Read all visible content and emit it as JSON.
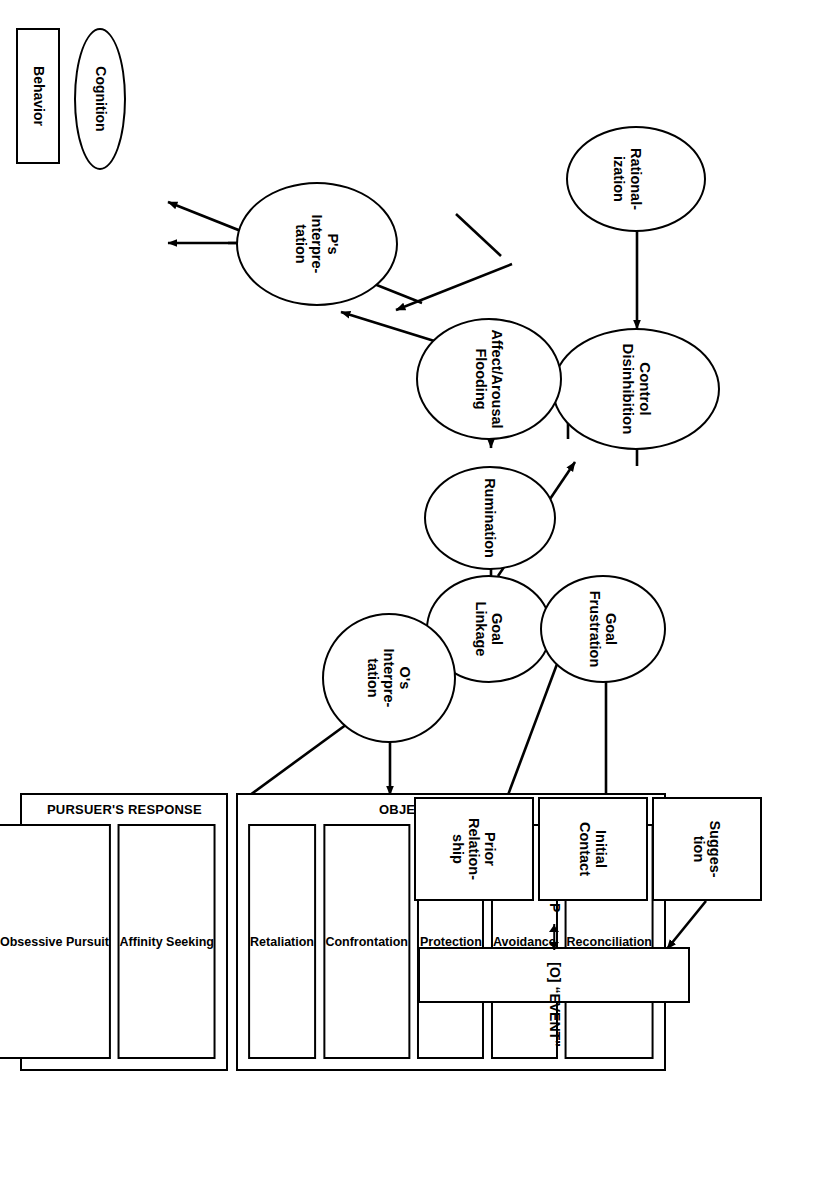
{
  "figure": {
    "type": "flowchart-diagram",
    "orientation": "rotated-90-clockwise",
    "stroke_color": "#000000",
    "background_color": "#ffffff"
  },
  "legend": {
    "cognition_label": "Cognition",
    "behavior_label": "Behavior",
    "cognition_shape": "ellipse",
    "behavior_shape": "rectangle"
  },
  "cognition_nodes": [
    {
      "id": "rationalization",
      "label_lines": [
        "Rational-",
        "ization"
      ]
    },
    {
      "id": "control_disinhibition",
      "label_lines": [
        "Control",
        "Disinhibition"
      ]
    },
    {
      "id": "rumination",
      "label_lines": [
        "Rumination"
      ]
    },
    {
      "id": "affect_arousal_flooding",
      "label_lines": [
        "Affect/Arousal",
        "Flooding"
      ]
    },
    {
      "id": "ps_interpretation",
      "label_lines": [
        "P's",
        "Interpre-",
        "tation"
      ]
    },
    {
      "id": "goal_linkage",
      "label_lines": [
        "Goal",
        "Linkage"
      ]
    },
    {
      "id": "goal_frustration",
      "label_lines": [
        "Goal",
        "Frustration"
      ]
    },
    {
      "id": "os_interpretation",
      "label_lines": [
        "O's",
        "Interpre-",
        "tation"
      ]
    }
  ],
  "input_boxes": [
    {
      "id": "suggestion",
      "label_lines": [
        "Sugges-",
        "tion"
      ]
    },
    {
      "id": "initial_contact",
      "label_lines": [
        "Initial",
        "Contact"
      ]
    },
    {
      "id": "prior_relationship",
      "label_lines": [
        "Prior",
        "Relation-",
        "ship"
      ]
    }
  ],
  "event_box": {
    "id": "event",
    "left_label": "P",
    "right_label": "[O] “EVENT”",
    "connector": "double-headed-arrow"
  },
  "objects_response": {
    "title": "OBJECT'S RESPONSE",
    "items": [
      "Reconciliation",
      "Avoidance",
      "Protection",
      "Confrontation",
      "Retaliation"
    ]
  },
  "pursuers_response": {
    "title": "PURSUER'S RESPONSE",
    "items": [
      "Affinity Seeking",
      "Obsessive Pursuit",
      "Aggression"
    ]
  },
  "edges": [
    {
      "from": "rationalization",
      "to": "control_disinhibition",
      "style": "single-arrow"
    },
    {
      "from": "rumination",
      "to": "rationalization",
      "style": "single-arrow"
    },
    {
      "from": "rumination",
      "to": "affect_arousal_flooding",
      "style": "double-arrow"
    },
    {
      "from": "affect_arousal_flooding",
      "to": "control_disinhibition",
      "style": "single-arrow"
    },
    {
      "from": "control_disinhibition",
      "to": "ps_interpretation",
      "style": "single-arrow"
    },
    {
      "from": "affect_arousal_flooding",
      "to": "ps_interpretation",
      "style": "single-arrow"
    },
    {
      "from": "affect_arousal_flooding",
      "to": "pursuers_response",
      "style": "single-arrow"
    },
    {
      "from": "ps_interpretation",
      "to": "pursuers_response",
      "style": "single-arrow"
    },
    {
      "from": "goal_linkage",
      "to": "rumination",
      "style": "single-arrow"
    },
    {
      "from": "goal_linkage",
      "to": "affect_arousal_flooding",
      "style": "single-arrow"
    },
    {
      "from": "event",
      "to": "goal_frustration",
      "style": "single-arrow"
    },
    {
      "from": "objects_response",
      "to": "goal_linkage",
      "style": "single-arrow"
    },
    {
      "from": "os_interpretation",
      "to": "objects_response",
      "style": "single-arrow"
    },
    {
      "from": "pursuers_response",
      "to": "os_interpretation",
      "style": "single-arrow"
    },
    {
      "from": "suggestion",
      "to": "event",
      "style": "single-arrow"
    },
    {
      "from": "initial_contact",
      "to": "event",
      "style": "single-arrow"
    },
    {
      "from": "prior_relationship",
      "to": "event",
      "style": "single-arrow"
    }
  ]
}
